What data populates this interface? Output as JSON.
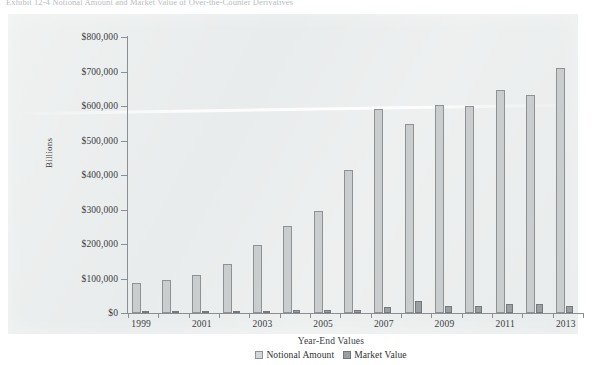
{
  "caption": "Exhibit 12-4  Notional Amount and Market Value of Over-the-Counter Derivatives",
  "chart_data": {
    "type": "bar",
    "title": "",
    "xlabel": "Year-End Values",
    "ylabel": "Billions",
    "ylim": [
      0,
      800000
    ],
    "ytick_step": 100000,
    "grid": false,
    "legend_position": "bottom",
    "categories": [
      "1999",
      "2000",
      "2001",
      "2002",
      "2003",
      "2004",
      "2005",
      "2006",
      "2007",
      "2008",
      "2009",
      "2010",
      "2011",
      "2012",
      "2013"
    ],
    "xtick_labels": [
      "1999",
      "2001",
      "2003",
      "2005",
      "2007",
      "2009",
      "2011",
      "2013"
    ],
    "ytick_labels": [
      "$0",
      "$100,000",
      "$200,000",
      "$300,000",
      "$400,000",
      "$500,000",
      "$600,000",
      "$700,000",
      "$800,000"
    ],
    "series": [
      {
        "name": "Notional Amount",
        "color": "#c9cdcd",
        "values": [
          88000,
          95000,
          111000,
          142000,
          197000,
          251000,
          297000,
          414000,
          591000,
          547000,
          604000,
          601000,
          647000,
          633000,
          710000
        ]
      },
      {
        "name": "Market Value",
        "color": "#9a9fa2",
        "values": [
          2400,
          3200,
          3800,
          6400,
          7000,
          9400,
          10000,
          10000,
          16000,
          35000,
          21000,
          21000,
          27000,
          25000,
          19000
        ]
      }
    ]
  }
}
